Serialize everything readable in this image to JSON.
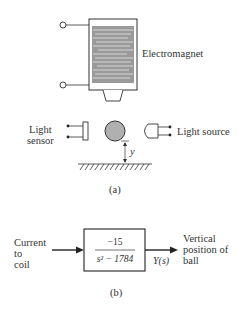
{
  "figure_a": {
    "electromagnet_label": "Electromagnet",
    "sensor_label_line1": "Light",
    "sensor_label_line2": "sensor",
    "source_label": "Light source",
    "distance_label": "y",
    "caption": "(a)"
  },
  "figure_b": {
    "input_label_line1": "Current",
    "input_label_line2": "to",
    "input_label_line3": "coil",
    "numerator": "−15",
    "denominator": "s² − 1784",
    "output_signal": "Y(s)",
    "output_label_line1": "Vertical",
    "output_label_line2": "position of",
    "output_label_line3": "ball",
    "caption": "(b)"
  },
  "colors": {
    "ink": "#2a2a2a",
    "coil_fill": "#9a9a9a",
    "ball_fill": "#b0b0b0"
  }
}
